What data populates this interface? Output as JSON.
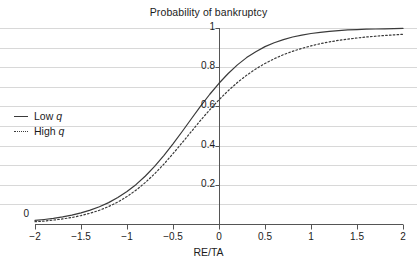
{
  "chart_data": {
    "type": "line",
    "title": "Probability of bankruptcy",
    "xlabel": "RE/TA",
    "ylabel": "",
    "xlim": [
      -2,
      2
    ],
    "ylim": [
      0,
      1
    ],
    "grid": true,
    "grid_axis": "y",
    "grid_step": 0.1,
    "legend_position": "left-middle",
    "xticks": [
      "-2",
      "-1.5",
      "-1",
      "-0.5",
      "0",
      "0.5",
      "1",
      "1.5",
      "2"
    ],
    "xtick_values": [
      -2,
      -1.5,
      -1,
      -0.5,
      0,
      0.5,
      1,
      1.5,
      2
    ],
    "yticks": [
      "0",
      "0.2",
      "0.4",
      "0.6",
      "0.8",
      "1"
    ],
    "ytick_values": [
      0,
      0.2,
      0.4,
      0.6,
      0.8,
      1
    ],
    "x": [
      -2,
      -1.9,
      -1.8,
      -1.7,
      -1.6,
      -1.5,
      -1.4,
      -1.3,
      -1.2,
      -1.1,
      -1,
      -0.9,
      -0.8,
      -0.7,
      -0.6,
      -0.5,
      -0.4,
      -0.3,
      -0.2,
      -0.1,
      0,
      0.1,
      0.2,
      0.3,
      0.4,
      0.5,
      0.6,
      0.7,
      0.8,
      0.9,
      1,
      1.1,
      1.2,
      1.3,
      1.4,
      1.5,
      1.6,
      1.7,
      1.8,
      1.9,
      2
    ],
    "series": [
      {
        "name": "Low q",
        "style": "solid",
        "color": "#3a3a3a",
        "values": [
          0.018,
          0.023,
          0.029,
          0.036,
          0.045,
          0.057,
          0.071,
          0.088,
          0.109,
          0.135,
          0.166,
          0.202,
          0.245,
          0.294,
          0.349,
          0.409,
          0.472,
          0.537,
          0.601,
          0.662,
          0.718,
          0.768,
          0.812,
          0.849,
          0.879,
          0.905,
          0.925,
          0.941,
          0.954,
          0.964,
          0.972,
          0.978,
          0.983,
          0.987,
          0.99,
          0.992,
          0.994,
          0.995,
          0.996,
          0.997,
          0.998
        ]
      },
      {
        "name": "High q",
        "style": "dotted",
        "color": "#3a3a3a",
        "values": [
          0.012,
          0.015,
          0.02,
          0.026,
          0.033,
          0.043,
          0.055,
          0.07,
          0.089,
          0.112,
          0.14,
          0.173,
          0.212,
          0.256,
          0.305,
          0.359,
          0.415,
          0.472,
          0.529,
          0.583,
          0.634,
          0.68,
          0.722,
          0.759,
          0.791,
          0.819,
          0.843,
          0.864,
          0.881,
          0.896,
          0.909,
          0.92,
          0.929,
          0.937,
          0.943,
          0.949,
          0.954,
          0.958,
          0.962,
          0.965,
          0.968
        ]
      }
    ],
    "legend_entries": [
      {
        "label_prefix": "Low ",
        "label_italic": "q",
        "style": "solid"
      },
      {
        "label_prefix": "High ",
        "label_italic": "q",
        "style": "dotted"
      }
    ],
    "colors": {
      "grid": "#d8d8d8",
      "axis": "#555555",
      "curve": "#3a3a3a",
      "text": "#1c1c1c",
      "background": "#ffffff"
    }
  }
}
